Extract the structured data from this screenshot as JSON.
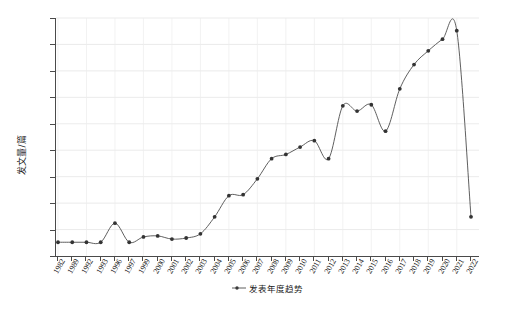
{
  "chart_data": {
    "type": "line",
    "title": "",
    "xlabel": "",
    "ylabel": "发文量/篇",
    "legend": [
      {
        "name": "发表年度趋势",
        "color": "#4d4d4d"
      }
    ],
    "legend_position": "bottom-center",
    "grid": true,
    "ylim": [
      0,
      225
    ],
    "yticks": [
      0,
      25,
      50,
      75,
      100,
      125,
      150,
      175,
      200,
      225
    ],
    "ytick_labels": [
      "0",
      "25",
      "50",
      "75",
      "100",
      "125",
      "150",
      "175",
      "200",
      "225"
    ],
    "categories": [
      "1982",
      "1989",
      "1992",
      "1993",
      "1996",
      "1997",
      "1999",
      "2000",
      "2001",
      "2002",
      "2003",
      "2004",
      "2005",
      "2006",
      "2007",
      "2008",
      "2009",
      "2010",
      "2011",
      "2012",
      "2013",
      "2014",
      "2015",
      "2016",
      "2017",
      "2018",
      "2019",
      "2020",
      "2021",
      "2022"
    ],
    "x": [
      "1982",
      "1989",
      "1992",
      "1993",
      "1996",
      "1997",
      "1999",
      "2000",
      "2001",
      "2002",
      "2003",
      "2004",
      "2005",
      "2006",
      "2007",
      "2008",
      "2009",
      "2010",
      "2011",
      "2012",
      "2013",
      "2014",
      "2015",
      "2016",
      "2017",
      "2018",
      "2019",
      "2020",
      "2021",
      "2022"
    ],
    "series": [
      {
        "name": "发表年度趋势",
        "color": "#4d4d4d",
        "marker": "circle",
        "values": [
          13,
          13,
          13,
          13,
          31,
          13,
          18,
          19,
          16,
          17,
          21,
          37,
          57,
          58,
          73,
          92,
          96,
          103,
          109,
          92,
          142,
          137,
          143,
          118,
          158,
          181,
          194,
          205,
          213,
          37
        ]
      }
    ]
  },
  "axis": {
    "y_title": "发文量/篇"
  },
  "legend_label": "发表年度趋势"
}
